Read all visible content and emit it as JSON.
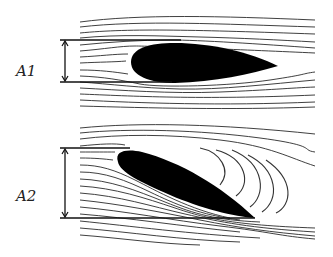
{
  "diagram": {
    "type": "airfoil streamline comparison",
    "panels": [
      {
        "id": "top",
        "label": "A1",
        "description": "Airfoil at low angle of attack, smooth streamlines, capture height A1"
      },
      {
        "id": "bottom",
        "label": "A2",
        "description": "Airfoil at high angle of attack, flow separation with vortices, capture height A2"
      }
    ],
    "colors": {
      "airfoil": "#000000",
      "streamline": "#2a2a2a",
      "background": "#ffffff"
    }
  }
}
